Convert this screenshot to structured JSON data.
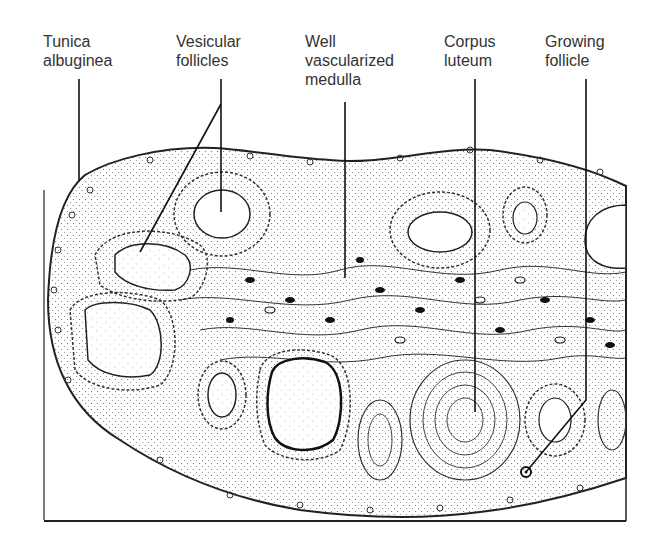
{
  "figure": {
    "labels": [
      {
        "id": "tunica",
        "text": "Tunica\nalbuginea"
      },
      {
        "id": "vesicular",
        "text": "Vesicular\nfollicles"
      },
      {
        "id": "medulla",
        "text": "Well\nvascularized\nmedulla"
      },
      {
        "id": "corpus",
        "text": "Corpus\nluteum"
      },
      {
        "id": "growing",
        "text": "Growing\nfollicle"
      }
    ]
  }
}
